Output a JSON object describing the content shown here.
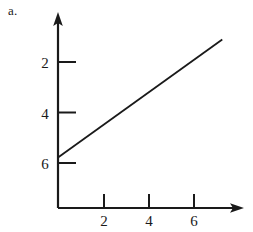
{
  "figure": {
    "part_label": "a.",
    "background_color": "#ffffff",
    "ink_color": "#1a1a1a"
  },
  "chart_data": {
    "type": "line",
    "title": "",
    "subtitle": "",
    "xlabel": "",
    "ylabel": "",
    "grid": false,
    "legend": false,
    "axis_style": "arrow-ended axes through origin",
    "xlim": [
      0,
      8.2
    ],
    "ylim": [
      0,
      7.8
    ],
    "xticks": [
      2,
      4,
      6
    ],
    "yticks": [
      2,
      4,
      6
    ],
    "xtick_labels": [
      "2",
      "4",
      "6"
    ],
    "ytick_labels": [
      "2",
      "4",
      "6"
    ],
    "xtick_position": "above-axis",
    "ytick_position": "right-of-axis",
    "series": [
      {
        "name": "line",
        "slope": 0.64,
        "intercept": 2,
        "x": [
          0,
          7.3
        ],
        "y": [
          2,
          4.64
        ],
        "points": [
          {
            "x": 0,
            "y": 2
          },
          {
            "x": 7.3,
            "y": 6.67
          }
        ]
      }
    ],
    "annotations": [
      "a."
    ]
  }
}
